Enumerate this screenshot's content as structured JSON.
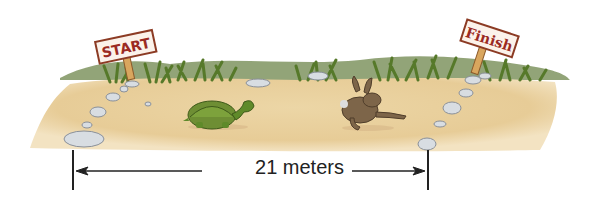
{
  "scene": {
    "start_sign": "START",
    "finish_sign": "Finish",
    "characters": [
      "tortoise",
      "hare"
    ]
  },
  "measurement": {
    "label": "21 meters",
    "value": 21,
    "unit": "meters"
  },
  "colors": {
    "ground": "#e9cf9c",
    "grass": "#5e7f2c",
    "hill": "#7f9460",
    "sign_text": "#9b2a22",
    "sign_border": "#8c3b24",
    "rock": "#d8dde2",
    "tortoise": "#5f8a2a",
    "hare": "#7d6549"
  }
}
